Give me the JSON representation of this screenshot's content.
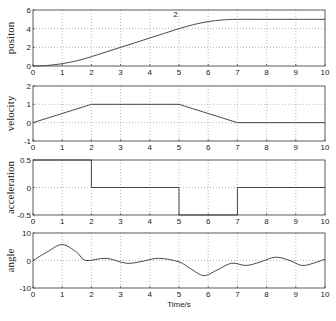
{
  "chart_data": [
    {
      "type": "line",
      "ylabel": "positon",
      "xlabel": "",
      "xlim": [
        0,
        10
      ],
      "ylim": [
        0,
        6
      ],
      "yticks": [
        0,
        2,
        4,
        6
      ],
      "xticks": [
        0,
        1,
        2,
        3,
        4,
        5,
        6,
        7,
        8,
        9,
        10
      ],
      "grid": true,
      "annotation": "2",
      "series": [
        {
          "name": "position",
          "x": [
            0,
            0.5,
            1,
            1.5,
            2,
            2.5,
            3,
            3.5,
            4,
            4.5,
            5,
            5.5,
            6,
            6.5,
            7,
            8,
            9,
            10
          ],
          "y": [
            0,
            0.06,
            0.25,
            0.56,
            1.0,
            1.5,
            2.0,
            2.5,
            3.0,
            3.5,
            4.0,
            4.44,
            4.75,
            4.94,
            5.0,
            5.0,
            5.0,
            5.0
          ]
        }
      ]
    },
    {
      "type": "line",
      "ylabel": "velocity",
      "xlabel": "",
      "xlim": [
        0,
        10
      ],
      "ylim": [
        -1,
        2
      ],
      "yticks": [
        -1,
        0,
        1,
        2
      ],
      "xticks": [
        0,
        1,
        2,
        3,
        4,
        5,
        6,
        7,
        8,
        9,
        10
      ],
      "grid": true,
      "series": [
        {
          "name": "velocity",
          "x": [
            0,
            2,
            5,
            7,
            10
          ],
          "y": [
            0,
            1,
            1,
            0,
            0
          ]
        }
      ]
    },
    {
      "type": "line",
      "ylabel": "acceleration",
      "xlabel": "",
      "xlim": [
        0,
        10
      ],
      "ylim": [
        -0.5,
        0.5
      ],
      "yticks": [
        -0.5,
        0,
        0.5
      ],
      "xticks": [
        0,
        1,
        2,
        3,
        4,
        5,
        6,
        7,
        8,
        9,
        10
      ],
      "grid": true,
      "series": [
        {
          "name": "acceleration",
          "x": [
            0,
            2,
            2,
            5,
            5,
            7,
            7,
            10
          ],
          "y": [
            0.5,
            0.5,
            0,
            0,
            -0.5,
            -0.5,
            0,
            0
          ]
        }
      ]
    },
    {
      "type": "line",
      "ylabel": "angle",
      "xlabel": "Time/s",
      "xlim": [
        0,
        10
      ],
      "ylim": [
        -10,
        10
      ],
      "yticks": [
        -10,
        0,
        10
      ],
      "xticks": [
        0,
        1,
        2,
        3,
        4,
        5,
        6,
        7,
        8,
        9,
        10
      ],
      "grid": true,
      "series": [
        {
          "name": "angle",
          "x": [
            0,
            0.5,
            1,
            1.5,
            1.8,
            2.5,
            3.2,
            3.7,
            4.3,
            5,
            5.4,
            5.85,
            6.3,
            6.8,
            7.3,
            7.8,
            8.3,
            8.8,
            9.2,
            9.6,
            10
          ],
          "y": [
            0,
            3.2,
            5.8,
            3.0,
            0,
            0.8,
            -1.0,
            -0.4,
            0.8,
            -0.5,
            -3.0,
            -5.5,
            -3.5,
            -1.0,
            -1.8,
            -0.5,
            1.2,
            0,
            -1.8,
            -1.0,
            0.5
          ]
        }
      ]
    }
  ]
}
